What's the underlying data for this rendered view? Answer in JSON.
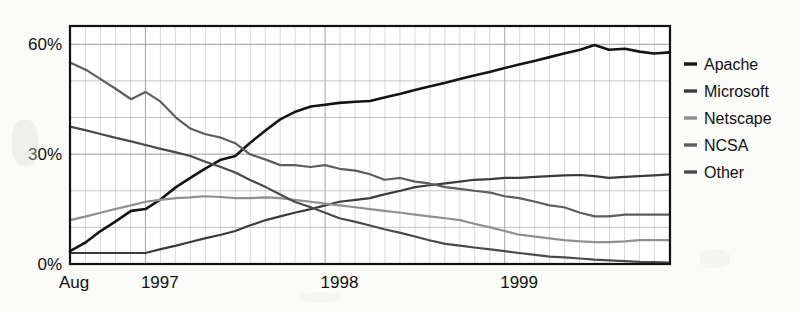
{
  "chart_data": {
    "type": "line",
    "title": "",
    "subtitle": "",
    "xlabel": "",
    "ylabel": "",
    "xlim": [
      1996.58,
      1999.92
    ],
    "ylim": [
      0,
      65
    ],
    "grid": true,
    "legend_position": "right",
    "y_ticks": [
      0,
      30,
      60
    ],
    "y_tick_labels": [
      "0%",
      "30%",
      "60%"
    ],
    "x_ticks": [
      1996.58,
      1996.0,
      1997.0,
      1998.0,
      1999.0
    ],
    "x_tick_labels": [
      "Aug",
      "1996",
      "1997",
      "1998",
      "1999"
    ],
    "x_label_positions": [
      1996.62,
      1997.08,
      1998.08,
      1999.08,
      2000.08
    ],
    "x": [
      1996.58,
      1996.67,
      1996.75,
      1996.83,
      1996.92,
      1997.0,
      1997.08,
      1997.17,
      1997.25,
      1997.33,
      1997.42,
      1997.5,
      1997.58,
      1997.67,
      1997.75,
      1997.83,
      1997.92,
      1998.0,
      1998.08,
      1998.17,
      1998.25,
      1998.33,
      1998.42,
      1998.5,
      1998.58,
      1998.67,
      1998.75,
      1998.83,
      1998.92,
      1999.0,
      1999.08,
      1999.17,
      1999.25,
      1999.33,
      1999.42,
      1999.5,
      1999.58,
      1999.67,
      1999.75,
      1999.83,
      1999.92
    ],
    "series": [
      {
        "name": "Apache",
        "color": "#141414",
        "width": 2.6,
        "values": [
          3.5,
          6.0,
          9.0,
          11.5,
          14.5,
          15.0,
          17.5,
          21.0,
          23.5,
          26.0,
          28.5,
          29.5,
          33.0,
          36.5,
          39.5,
          41.5,
          43.0,
          43.5,
          44.0,
          44.3,
          44.5,
          45.5,
          46.5,
          47.5,
          48.5,
          49.5,
          50.5,
          51.5,
          52.5,
          53.5,
          54.5,
          55.5,
          56.5,
          57.5,
          58.5,
          59.8,
          58.5,
          58.8,
          58.0,
          57.5,
          57.8
        ]
      },
      {
        "name": "Microsoft",
        "color": "#3b3b3b",
        "width": 2.2,
        "values": [
          3.0,
          3.0,
          3.0,
          3.0,
          3.0,
          3.0,
          4.0,
          5.0,
          6.0,
          7.0,
          8.0,
          9.0,
          10.5,
          12.0,
          13.0,
          14.0,
          15.0,
          16.0,
          17.0,
          17.5,
          18.0,
          19.0,
          20.0,
          21.0,
          21.5,
          22.0,
          22.5,
          23.0,
          23.2,
          23.5,
          23.5,
          23.8,
          24.0,
          24.2,
          24.3,
          24.0,
          23.5,
          23.8,
          24.0,
          24.2,
          24.5
        ]
      },
      {
        "name": "Netscape",
        "color": "#8f8f8f",
        "width": 2.2,
        "values": [
          12.0,
          13.0,
          14.0,
          15.0,
          16.0,
          17.0,
          17.5,
          18.0,
          18.2,
          18.5,
          18.3,
          18.0,
          18.0,
          18.2,
          18.0,
          17.5,
          17.0,
          16.5,
          16.0,
          15.5,
          15.0,
          14.5,
          14.0,
          13.5,
          13.0,
          12.5,
          12.0,
          11.0,
          10.0,
          9.0,
          8.0,
          7.5,
          7.0,
          6.5,
          6.2,
          6.0,
          6.0,
          6.2,
          6.5,
          6.5,
          6.5
        ]
      },
      {
        "name": "NCSA",
        "color": "#5e5e5e",
        "width": 2.2,
        "values": [
          55.0,
          53.0,
          50.5,
          48.0,
          45.0,
          47.0,
          44.5,
          40.0,
          37.0,
          35.5,
          34.5,
          33.0,
          30.0,
          28.5,
          27.0,
          27.0,
          26.5,
          27.0,
          26.0,
          25.5,
          24.5,
          23.0,
          23.5,
          22.5,
          22.0,
          21.0,
          20.5,
          20.0,
          19.5,
          18.5,
          18.0,
          17.0,
          16.0,
          15.5,
          14.0,
          13.0,
          13.0,
          13.5,
          13.5,
          13.5,
          13.5
        ]
      },
      {
        "name": "Other",
        "color": "#4a4a4a",
        "width": 2.2,
        "values": [
          37.5,
          36.5,
          35.5,
          34.5,
          33.5,
          32.5,
          31.5,
          30.5,
          29.5,
          28.0,
          26.5,
          25.0,
          23.0,
          21.0,
          19.0,
          17.0,
          15.5,
          14.0,
          12.5,
          11.5,
          10.5,
          9.5,
          8.5,
          7.5,
          6.5,
          5.5,
          5.0,
          4.5,
          4.0,
          3.5,
          3.0,
          2.5,
          2.0,
          1.8,
          1.5,
          1.2,
          1.0,
          0.8,
          0.6,
          0.5,
          0.4
        ]
      }
    ]
  },
  "legend": {
    "items": [
      {
        "label": "Apache",
        "color": "#141414"
      },
      {
        "label": "Microsoft",
        "color": "#3b3b3b"
      },
      {
        "label": "Netscape",
        "color": "#8f8f8f"
      },
      {
        "label": "NCSA",
        "color": "#5e5e5e"
      },
      {
        "label": "Other",
        "color": "#4a4a4a"
      }
    ]
  },
  "axes": {
    "y_labels": [
      "60%",
      "30%",
      "0%"
    ],
    "x_labels": [
      "Aug",
      "1996",
      "1997",
      "1998",
      "1999"
    ]
  }
}
